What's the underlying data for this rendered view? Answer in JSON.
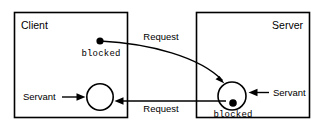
{
  "diagram": {
    "background_color": "#ffffff",
    "stroke_color": "#000000",
    "boxes": [
      {
        "id": "client",
        "label": "Client",
        "label_align": "left"
      },
      {
        "id": "server",
        "label": "Server",
        "label_align": "right"
      }
    ],
    "states": [
      {
        "id": "client_blocked",
        "label": "blocked",
        "style": "monospace"
      },
      {
        "id": "server_blocked",
        "label": "blocked",
        "style": "monospace"
      }
    ],
    "messages": [
      {
        "id": "request_out",
        "label": "Request",
        "direction": "client-to-server"
      },
      {
        "id": "request_in",
        "label": "Request",
        "direction": "server-to-client"
      }
    ],
    "annotations": [
      {
        "id": "servant_client",
        "label": "Servant",
        "points_to": "client-circle"
      },
      {
        "id": "servant_server",
        "label": "Servant",
        "points_to": "server-circle"
      }
    ]
  }
}
